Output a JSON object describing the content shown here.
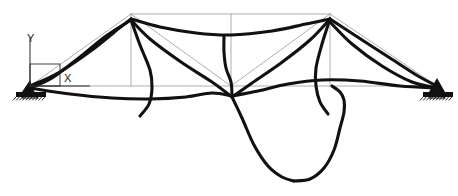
{
  "figure": {
    "title": "",
    "type": "structural-deformed-shape",
    "width": 458,
    "height": 196,
    "background_color": "#ffffff"
  },
  "axes_indicator": {
    "name": "coordinate-triad",
    "x_label": "X",
    "y_label": "Y",
    "origin_px": [
      30,
      86
    ],
    "x_axis_end_px": [
      90,
      86
    ],
    "y_axis_end_px": [
      30,
      38
    ],
    "box_px": [
      30,
      64,
      30,
      22
    ],
    "line_color": "#2b2b2b",
    "label_color": "#1a1a1a"
  },
  "styles": {
    "undeformed_color": "#9a9a9a",
    "undeformed_width": 0.8,
    "deformed_color": "#111111",
    "deformed_width": 3.1,
    "support_color": "#111111"
  },
  "chart_data": {
    "type": "line",
    "title": "",
    "xlabel": "X",
    "ylabel": "Y",
    "legend": [
      {
        "name": "Undeformed structure",
        "color": "#9a9a9a",
        "style": "thin-line"
      },
      {
        "name": "Deformed shape",
        "color": "#111111",
        "style": "thick-line"
      }
    ],
    "nodes": {
      "left_support": [
        30,
        86
      ],
      "right_support": [
        437,
        86
      ],
      "left_top": [
        131,
        14
      ],
      "right_top": [
        330,
        14
      ],
      "mid_top": [
        231,
        14
      ],
      "mid_bottom": [
        231,
        86
      ],
      "left_bottom": [
        131,
        86
      ],
      "right_bottom": [
        330,
        86
      ]
    },
    "undeformed_members": [
      {
        "name": "bottom-chord",
        "points": [
          [
            30,
            86
          ],
          [
            437,
            86
          ]
        ]
      },
      {
        "name": "top-chord",
        "points": [
          [
            131,
            14
          ],
          [
            330,
            14
          ]
        ]
      },
      {
        "name": "left-diagonal-up",
        "points": [
          [
            30,
            86
          ],
          [
            131,
            14
          ]
        ]
      },
      {
        "name": "right-diagonal-up",
        "points": [
          [
            437,
            86
          ],
          [
            330,
            14
          ]
        ]
      },
      {
        "name": "left-vertical",
        "points": [
          [
            131,
            14
          ],
          [
            131,
            86
          ]
        ]
      },
      {
        "name": "mid-vertical",
        "points": [
          [
            231,
            14
          ],
          [
            231,
            86
          ]
        ]
      },
      {
        "name": "right-vertical",
        "points": [
          [
            330,
            14
          ],
          [
            330,
            86
          ]
        ]
      },
      {
        "name": "left-inner-diagonal",
        "points": [
          [
            131,
            14
          ],
          [
            231,
            86
          ]
        ]
      },
      {
        "name": "right-inner-diagonal",
        "points": [
          [
            330,
            14
          ],
          [
            231,
            86
          ]
        ]
      }
    ],
    "deformed_curves": [
      {
        "name": "left-stay-lower",
        "points": [
          [
            30,
            88
          ],
          [
            52,
            78
          ],
          [
            80,
            57
          ],
          [
            106,
            36
          ],
          [
            131,
            20
          ]
        ]
      },
      {
        "name": "left-stay-upper",
        "points": [
          [
            30,
            86
          ],
          [
            58,
            73
          ],
          [
            92,
            50
          ],
          [
            118,
            29
          ],
          [
            131,
            19
          ]
        ]
      },
      {
        "name": "top-chord-sag",
        "points": [
          [
            131,
            19
          ],
          [
            160,
            27
          ],
          [
            196,
            33
          ],
          [
            231,
            35
          ],
          [
            272,
            31
          ],
          [
            306,
            24
          ],
          [
            330,
            19
          ]
        ]
      },
      {
        "name": "left-web-fan-a",
        "points": [
          [
            131,
            20
          ],
          [
            150,
            39
          ],
          [
            181,
            62
          ],
          [
            212,
            82
          ],
          [
            232,
            97
          ]
        ]
      },
      {
        "name": "left-web-fan-b",
        "points": [
          [
            131,
            20
          ],
          [
            140,
            45
          ],
          [
            150,
            70
          ],
          [
            152,
            88
          ],
          [
            149,
            104
          ],
          [
            140,
            116
          ]
        ]
      },
      {
        "name": "mid-vertical-deformed",
        "points": [
          [
            224,
            36
          ],
          [
            224,
            52
          ],
          [
            226,
            68
          ],
          [
            231,
            82
          ],
          [
            232,
            96
          ]
        ]
      },
      {
        "name": "right-web-fan-a",
        "points": [
          [
            330,
            19
          ],
          [
            310,
            40
          ],
          [
            281,
            63
          ],
          [
            252,
            83
          ],
          [
            232,
            97
          ]
        ]
      },
      {
        "name": "right-web-fan-b",
        "points": [
          [
            330,
            19
          ],
          [
            322,
            44
          ],
          [
            316,
            68
          ],
          [
            316,
            86
          ],
          [
            320,
            102
          ],
          [
            328,
            114
          ]
        ]
      },
      {
        "name": "right-stay-upper",
        "points": [
          [
            330,
            19
          ],
          [
            356,
            36
          ],
          [
            390,
            58
          ],
          [
            418,
            76
          ],
          [
            437,
            86
          ]
        ]
      },
      {
        "name": "right-stay-lower",
        "points": [
          [
            330,
            22
          ],
          [
            352,
            44
          ],
          [
            382,
            66
          ],
          [
            412,
            82
          ],
          [
            437,
            88
          ]
        ]
      },
      {
        "name": "bottom-chord-left-sag",
        "points": [
          [
            30,
            88
          ],
          [
            70,
            94
          ],
          [
            112,
            98
          ],
          [
            150,
            99
          ],
          [
            186,
            97
          ],
          [
            212,
            93
          ],
          [
            232,
            96
          ]
        ]
      },
      {
        "name": "bottom-chord-right-sag",
        "points": [
          [
            232,
            96
          ],
          [
            258,
            91
          ],
          [
            288,
            84
          ],
          [
            322,
            80
          ],
          [
            360,
            81
          ],
          [
            400,
            86
          ],
          [
            437,
            88
          ]
        ]
      },
      {
        "name": "deep-dip-left-limb",
        "points": [
          [
            232,
            97
          ],
          [
            242,
            118
          ],
          [
            254,
            145
          ],
          [
            268,
            166
          ],
          [
            282,
            177
          ],
          [
            294,
            181
          ]
        ]
      },
      {
        "name": "deep-dip-right-limb",
        "points": [
          [
            294,
            181
          ],
          [
            310,
            179
          ],
          [
            324,
            168
          ],
          [
            334,
            150
          ],
          [
            340,
            128
          ],
          [
            344,
            112
          ],
          [
            344,
            100
          ],
          [
            340,
            92
          ],
          [
            332,
            86
          ]
        ]
      }
    ],
    "supports": [
      {
        "name": "left-pin-support",
        "position": [
          30,
          86
        ],
        "type": "pinned-with-hatch",
        "base_px": [
          16,
          92,
          30,
          5
        ]
      },
      {
        "name": "right-pin-support",
        "position": [
          437,
          86
        ],
        "type": "pinned-with-hatch",
        "base_px": [
          423,
          92,
          30,
          5
        ]
      }
    ],
    "axis_ranges": {
      "xlim": [
        0,
        458
      ],
      "ylim": [
        196,
        0
      ]
    },
    "grid": false
  }
}
